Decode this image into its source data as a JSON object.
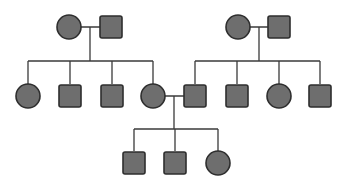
{
  "diagram": {
    "type": "pedigree-chart",
    "colors": {
      "affected_fill": "#6e6e6e",
      "outline": "#2e2e2e",
      "line": "#3a3a3a",
      "background": "#ffffff"
    },
    "legend_symbols": {
      "circle": "female",
      "square": "male",
      "filled": "affected"
    },
    "individuals": [
      {
        "id": "I-1",
        "generation": 1,
        "sex": "female",
        "affected": true,
        "cx": 69,
        "cy": 27
      },
      {
        "id": "I-2",
        "generation": 1,
        "sex": "male",
        "affected": true,
        "cx": 111,
        "cy": 27
      },
      {
        "id": "I-3",
        "generation": 1,
        "sex": "female",
        "affected": true,
        "cx": 238,
        "cy": 27
      },
      {
        "id": "I-4",
        "generation": 1,
        "sex": "male",
        "affected": true,
        "cx": 279,
        "cy": 27
      },
      {
        "id": "II-1",
        "generation": 2,
        "sex": "female",
        "affected": true,
        "cx": 28,
        "cy": 96
      },
      {
        "id": "II-2",
        "generation": 2,
        "sex": "male",
        "affected": true,
        "cx": 70,
        "cy": 96
      },
      {
        "id": "II-3",
        "generation": 2,
        "sex": "male",
        "affected": true,
        "cx": 112,
        "cy": 96
      },
      {
        "id": "II-4",
        "generation": 2,
        "sex": "female",
        "affected": true,
        "cx": 153,
        "cy": 96
      },
      {
        "id": "II-5",
        "generation": 2,
        "sex": "male",
        "affected": true,
        "cx": 195,
        "cy": 96
      },
      {
        "id": "II-6",
        "generation": 2,
        "sex": "male",
        "affected": true,
        "cx": 237,
        "cy": 96
      },
      {
        "id": "II-7",
        "generation": 2,
        "sex": "female",
        "affected": true,
        "cx": 279,
        "cy": 96
      },
      {
        "id": "II-8",
        "generation": 2,
        "sex": "male",
        "affected": true,
        "cx": 320,
        "cy": 96
      },
      {
        "id": "III-1",
        "generation": 3,
        "sex": "male",
        "affected": true,
        "cx": 134,
        "cy": 163
      },
      {
        "id": "III-2",
        "generation": 3,
        "sex": "male",
        "affected": true,
        "cx": 175,
        "cy": 163
      },
      {
        "id": "III-3",
        "generation": 3,
        "sex": "female",
        "affected": true,
        "cx": 218,
        "cy": 163
      }
    ],
    "matings": [
      {
        "partners": [
          "I-1",
          "I-2"
        ],
        "children": [
          "II-1",
          "II-2",
          "II-3",
          "II-4"
        ]
      },
      {
        "partners": [
          "I-3",
          "I-4"
        ],
        "children": [
          "II-5",
          "II-6",
          "II-7",
          "II-8"
        ]
      },
      {
        "partners": [
          "II-4",
          "II-5"
        ],
        "children": [
          "III-1",
          "III-2",
          "III-3"
        ]
      }
    ]
  }
}
